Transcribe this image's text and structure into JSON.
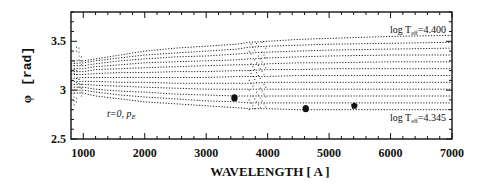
{
  "chart_data": {
    "type": "line",
    "title": "",
    "xlabel": "WAVELENGTH [ A ]",
    "ylabel": "φ [rad]",
    "xlim": [
      800,
      7000
    ],
    "ylim": [
      2.5,
      3.8
    ],
    "xticks": [
      1000,
      2000,
      3000,
      4000,
      5000,
      6000,
      7000
    ],
    "xtick_labels": [
      "1000",
      "2000",
      "3000",
      "4000",
      "5000",
      "6000",
      "7000"
    ],
    "yticks": [
      2.5,
      3,
      3.5
    ],
    "ytick_labels": [
      "2.5",
      "3",
      "3.5"
    ],
    "grid": false,
    "line_style": "dotted",
    "annotations": [
      {
        "text": "log T",
        "sub": "eff",
        "tail": "=4.400",
        "x": 6300,
        "y": 3.6
      },
      {
        "text": "log T",
        "sub": "eff",
        "tail": "=4.345",
        "x": 6300,
        "y": 2.75
      },
      {
        "text": "t=0,  p",
        "sub": "E",
        "x": 1250,
        "y": 2.68
      }
    ],
    "series_description": "12 dotted curves of phase φ vs wavelength for log Teff from 4.345 (bottom) to 4.400 (top); curves diverge from ~3.0-3.3 at 1000 A to ~2.80-3.56 at 7000 A, with wiggles near the Balmer jump (~3650-4000 A) and lines near 1200, 1550, 4340, 4860 A",
    "x": [
      800,
      1000,
      1200,
      1600,
      2000,
      2500,
      3000,
      3500,
      3700,
      4000,
      4500,
      5000,
      6000,
      7000
    ],
    "series": [
      {
        "name": "log Teff=4.400",
        "values": [
          3.3,
          3.3,
          3.32,
          3.36,
          3.4,
          3.43,
          3.45,
          3.47,
          3.49,
          3.5,
          3.52,
          3.53,
          3.55,
          3.56
        ]
      },
      {
        "name": "line 2",
        "values": [
          3.27,
          3.28,
          3.3,
          3.33,
          3.36,
          3.38,
          3.4,
          3.42,
          3.44,
          3.45,
          3.46,
          3.47,
          3.48,
          3.49
        ]
      },
      {
        "name": "line 3",
        "values": [
          3.25,
          3.25,
          3.27,
          3.3,
          3.32,
          3.34,
          3.35,
          3.37,
          3.38,
          3.39,
          3.4,
          3.41,
          3.42,
          3.43
        ]
      },
      {
        "name": "line 4",
        "values": [
          3.22,
          3.22,
          3.24,
          3.26,
          3.28,
          3.29,
          3.3,
          3.31,
          3.32,
          3.33,
          3.34,
          3.35,
          3.36,
          3.36
        ]
      },
      {
        "name": "line 5",
        "values": [
          3.19,
          3.19,
          3.21,
          3.22,
          3.23,
          3.24,
          3.25,
          3.26,
          3.26,
          3.27,
          3.28,
          3.28,
          3.29,
          3.29
        ]
      },
      {
        "name": "line 6",
        "values": [
          3.16,
          3.16,
          3.17,
          3.18,
          3.18,
          3.19,
          3.19,
          3.2,
          3.2,
          3.21,
          3.21,
          3.22,
          3.22,
          3.22
        ]
      },
      {
        "name": "line 7",
        "values": [
          3.12,
          3.13,
          3.13,
          3.13,
          3.13,
          3.13,
          3.13,
          3.14,
          3.14,
          3.14,
          3.15,
          3.15,
          3.15,
          3.15
        ]
      },
      {
        "name": "line 8",
        "values": [
          3.09,
          3.09,
          3.09,
          3.08,
          3.08,
          3.07,
          3.07,
          3.07,
          3.07,
          3.08,
          3.08,
          3.08,
          3.08,
          3.08
        ]
      },
      {
        "name": "line 9",
        "values": [
          3.06,
          3.06,
          3.05,
          3.04,
          3.03,
          3.02,
          3.01,
          3.01,
          3.01,
          3.01,
          3.01,
          3.01,
          3.01,
          3.01
        ]
      },
      {
        "name": "line 10",
        "values": [
          3.03,
          3.03,
          3.01,
          2.99,
          2.98,
          2.96,
          2.95,
          2.94,
          2.94,
          2.94,
          2.94,
          2.94,
          2.94,
          2.94
        ]
      },
      {
        "name": "line 11",
        "values": [
          3.0,
          3.0,
          2.98,
          2.95,
          2.93,
          2.91,
          2.89,
          2.88,
          2.87,
          2.87,
          2.87,
          2.87,
          2.87,
          2.87
        ]
      },
      {
        "name": "log Teff=4.345",
        "values": [
          2.97,
          2.97,
          2.94,
          2.91,
          2.88,
          2.86,
          2.84,
          2.82,
          2.81,
          2.81,
          2.8,
          2.8,
          2.8,
          2.8
        ]
      }
    ],
    "markers": [
      {
        "shape": "filled-circle",
        "x": 3460,
        "y": 2.92
      },
      {
        "shape": "filled-circle",
        "x": 4620,
        "y": 2.81
      },
      {
        "shape": "filled-pentagon",
        "x": 5410,
        "y": 2.84
      }
    ]
  },
  "labels": {
    "ylabel_phi": "φ",
    "ylabel_unit": "[rad]",
    "xlabel": "WAVELENGTH [ A ]",
    "top_annot_pre": "log T",
    "top_annot_sub": "eff",
    "top_annot_post": "=4.400",
    "bottom_annot_pre": "log T",
    "bottom_annot_sub": "eff",
    "bottom_annot_post": "=4.345",
    "model_annot_pre": "t=0,  p",
    "model_annot_sub": "E"
  }
}
